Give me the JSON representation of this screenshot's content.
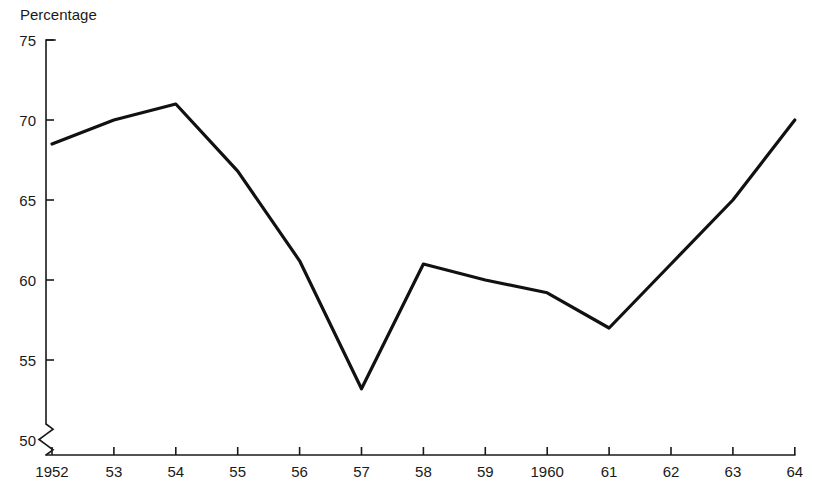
{
  "chart_data": {
    "type": "line",
    "title": "",
    "xlabel": "",
    "ylabel": "Percentage",
    "x": [
      1952,
      1953,
      1954,
      1955,
      1956,
      1957,
      1958,
      1959,
      1960,
      1961,
      1962,
      1963,
      1964
    ],
    "categories": [
      "1952",
      "53",
      "54",
      "55",
      "56",
      "57",
      "58",
      "59",
      "1960",
      "61",
      "62",
      "63",
      "64"
    ],
    "values": [
      68.5,
      70.0,
      71.0,
      66.8,
      61.2,
      53.2,
      61.0,
      60.0,
      59.2,
      57.0,
      61.0,
      65.0,
      70.0
    ],
    "series": [
      {
        "name": "Percentage",
        "values": [
          68.5,
          70.0,
          71.0,
          66.8,
          61.2,
          53.2,
          61.0,
          60.0,
          59.2,
          57.0,
          61.0,
          65.0,
          70.0
        ],
        "color": "#111111"
      }
    ],
    "ylim": [
      50,
      75
    ],
    "yticks": [
      50,
      55,
      60,
      65,
      70,
      75
    ],
    "ytick_labels": [
      "50",
      "55",
      "60",
      "65",
      "70",
      "75"
    ],
    "xtick_labels": [
      "1952",
      "53",
      "54",
      "55",
      "56",
      "57",
      "58",
      "59",
      "1960",
      "61",
      "62",
      "63",
      "64"
    ],
    "grid": false,
    "legend": false,
    "legend_position": "none",
    "axis_break": true,
    "axis_break_note": "zigzag break on y-axis below 50",
    "markers": false,
    "line_color": "#111111",
    "axis_color": "#1a1a1a",
    "background": "#ffffff"
  },
  "labels": {
    "y_axis_caption": "Percentage"
  }
}
